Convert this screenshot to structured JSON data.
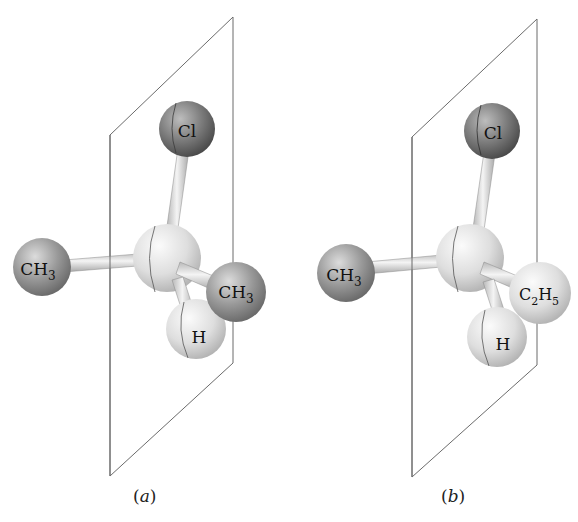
{
  "figure": {
    "panels": [
      {
        "id": "a",
        "caption_open": "(",
        "caption_letter": "a",
        "caption_close": ")",
        "atoms": {
          "top": {
            "symbol": "Cl",
            "sub": ""
          },
          "left": {
            "symbol": "CH",
            "sub": "3"
          },
          "right": {
            "symbol": "CH",
            "sub": "3"
          },
          "front": {
            "symbol": "H",
            "sub": ""
          },
          "center": {
            "symbol": "C",
            "sub": ""
          }
        }
      },
      {
        "id": "b",
        "caption_open": "(",
        "caption_letter": "b",
        "caption_close": ")",
        "atoms": {
          "top": {
            "symbol": "Cl",
            "sub": ""
          },
          "left": {
            "symbol": "CH",
            "sub": "3"
          },
          "right": {
            "symbol": "C",
            "sub": "2",
            "symbol2": "H",
            "sub2": "5"
          },
          "front": {
            "symbol": "H",
            "sub": ""
          },
          "center": {
            "symbol": "C",
            "sub": ""
          }
        }
      }
    ],
    "colors": {
      "plane_line": "#6b6b6b",
      "dark_atom": "#6e6e6e",
      "light_atom": "#d9d9d9",
      "bond": "#d0d0d0"
    }
  }
}
